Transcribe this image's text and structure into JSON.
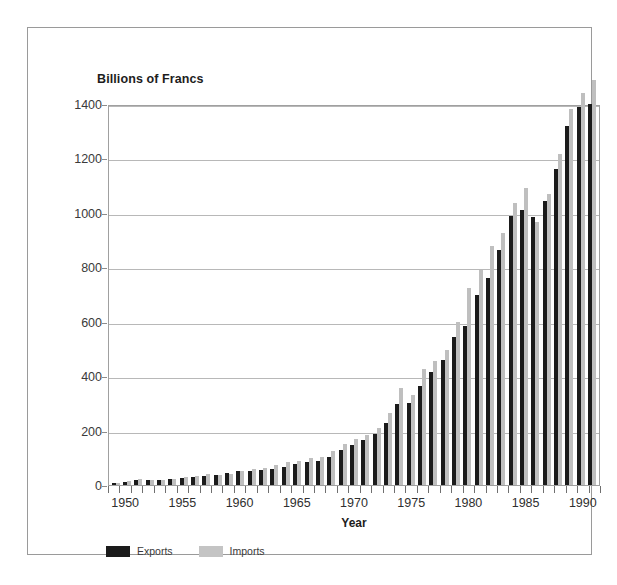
{
  "chart_data": {
    "type": "bar",
    "title": "Billions of Francs",
    "xlabel": "Year",
    "ylabel": "Billions of Francs",
    "ylim": [
      0,
      1400
    ],
    "ytick_step": 200,
    "yticks": [
      1400,
      1200,
      1000,
      800,
      600,
      400,
      200,
      0
    ],
    "grid": true,
    "legend_position": "bottom-left",
    "xtick_labels": [
      1950,
      1955,
      1960,
      1965,
      1970,
      1975,
      1980,
      1985,
      1990
    ],
    "categories": [
      1949,
      1950,
      1951,
      1952,
      1953,
      1954,
      1955,
      1956,
      1957,
      1958,
      1959,
      1960,
      1961,
      1962,
      1963,
      1964,
      1965,
      1966,
      1967,
      1968,
      1969,
      1970,
      1971,
      1972,
      1973,
      1974,
      1975,
      1976,
      1977,
      1978,
      1979,
      1980,
      1981,
      1982,
      1983,
      1984,
      1985,
      1986,
      1987,
      1988,
      1989,
      1990,
      1991
    ],
    "series": [
      {
        "name": "Exports",
        "color": "#1b1b1b",
        "values": [
          8,
          12,
          18,
          20,
          19,
          22,
          27,
          28,
          33,
          37,
          45,
          50,
          53,
          56,
          60,
          66,
          76,
          84,
          90,
          104,
          127,
          148,
          164,
          186,
          228,
          297,
          302,
          364,
          414,
          460,
          545,
          585,
          700,
          760,
          865,
          990,
          1010,
          985,
          1045,
          1160,
          1320,
          1390,
          1400
        ]
      },
      {
        "name": "Imports",
        "color": "#bfbfbf",
        "values": [
          9,
          13,
          21,
          20,
          19,
          22,
          29,
          34,
          40,
          38,
          42,
          53,
          58,
          64,
          72,
          83,
          88,
          100,
          104,
          124,
          152,
          170,
          183,
          211,
          263,
          358,
          330,
          427,
          455,
          495,
          600,
          725,
          790,
          880,
          925,
          1035,
          1090,
          965,
          1070,
          1215,
          1380,
          1440,
          1490
        ]
      }
    ],
    "note": "Values in billions of francs; exports shown in black, imports in light gray"
  },
  "legend": {
    "entries": [
      {
        "label": "Exports"
      },
      {
        "label": "Imports"
      }
    ]
  },
  "axes": {
    "x_title": "Year"
  }
}
